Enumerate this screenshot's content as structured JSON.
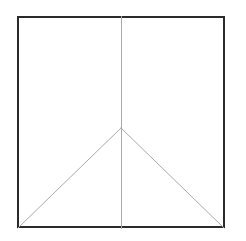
{
  "figure": {
    "type": "line-diagram",
    "canvas": {
      "width": 246,
      "height": 241,
      "background_color": "#ffffff"
    },
    "square": {
      "name": "outer-square",
      "left": 17,
      "top": 16,
      "right": 225,
      "bottom": 228,
      "width": 208,
      "height": 212,
      "stroke_color": "#2b2b2b",
      "stroke_width": 2,
      "fill_color": "#ffffff"
    },
    "median": {
      "name": "vertical-median-line",
      "x1": 121,
      "y1": 16,
      "x2": 121,
      "y2": 228,
      "stroke_color": "#aaaaaa",
      "stroke_width": 1
    },
    "apex": {
      "name": "triangle-apex",
      "x": 121,
      "y": 128
    },
    "diagonals": [
      {
        "name": "left-diagonal-line",
        "x1": 121,
        "y1": 128,
        "x2": 18,
        "y2": 228,
        "stroke_color": "#aaaaaa",
        "stroke_width": 1,
        "angle_degrees": 45
      },
      {
        "name": "right-diagonal-line",
        "x1": 121,
        "y1": 128,
        "x2": 224,
        "y2": 228,
        "stroke_color": "#aaaaaa",
        "stroke_width": 1,
        "angle_degrees": 45
      }
    ]
  }
}
